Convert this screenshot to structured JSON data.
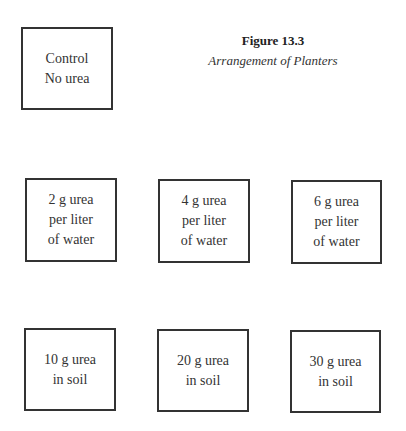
{
  "figure": {
    "number": "Figure 13.3",
    "caption": "Arrangement of Planters"
  },
  "planters": [
    {
      "id": "control",
      "lines": [
        "Control",
        "No urea"
      ],
      "box": {
        "x": 21,
        "y": 27,
        "w": 92,
        "h": 83
      }
    },
    {
      "id": "water-2g",
      "lines": [
        "2 g urea",
        "per liter",
        "of water"
      ],
      "box": {
        "x": 25,
        "y": 178,
        "w": 92,
        "h": 84
      }
    },
    {
      "id": "water-4g",
      "lines": [
        "4 g urea",
        "per liter",
        "of water"
      ],
      "box": {
        "x": 158,
        "y": 179,
        "w": 92,
        "h": 84
      }
    },
    {
      "id": "water-6g",
      "lines": [
        "6 g urea",
        "per liter",
        "of water"
      ],
      "box": {
        "x": 291,
        "y": 180,
        "w": 91,
        "h": 84
      }
    },
    {
      "id": "soil-10g",
      "lines": [
        "10 g urea",
        "in soil"
      ],
      "box": {
        "x": 24,
        "y": 328,
        "w": 92,
        "h": 83
      }
    },
    {
      "id": "soil-20g",
      "lines": [
        "20 g urea",
        "in soil"
      ],
      "box": {
        "x": 157,
        "y": 329,
        "w": 92,
        "h": 83
      }
    },
    {
      "id": "soil-30g",
      "lines": [
        "30 g urea",
        "in soil"
      ],
      "box": {
        "x": 290,
        "y": 330,
        "w": 91,
        "h": 83
      }
    }
  ]
}
